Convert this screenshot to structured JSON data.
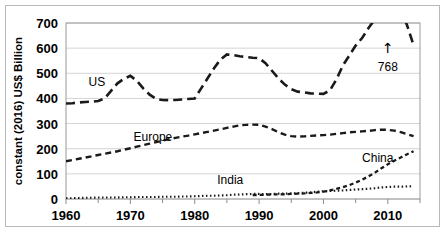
{
  "chart_data": {
    "type": "line",
    "title": "",
    "subtitle": "",
    "xlabel": "",
    "ylabel": "constant (2016) US$ Billion",
    "xlim": [
      1960,
      2015
    ],
    "ylim": [
      0,
      700
    ],
    "xticks": [
      1960,
      1970,
      1980,
      1990,
      2000,
      2010
    ],
    "xtick_labels": [
      "1960",
      "1970",
      "1980",
      "1990",
      "2000",
      "2010"
    ],
    "yticks": [
      0,
      100,
      200,
      300,
      400,
      500,
      600,
      700
    ],
    "ytick_labels": [
      "0",
      "100",
      "200",
      "300",
      "400",
      "500",
      "600",
      "700"
    ],
    "grid": "horizontal",
    "legend_position": "inline-labels",
    "x": [
      1960,
      1961,
      1962,
      1963,
      1964,
      1965,
      1966,
      1967,
      1968,
      1969,
      1970,
      1971,
      1972,
      1973,
      1974,
      1975,
      1976,
      1977,
      1978,
      1979,
      1980,
      1981,
      1982,
      1983,
      1984,
      1985,
      1986,
      1987,
      1988,
      1989,
      1990,
      1991,
      1992,
      1993,
      1994,
      1995,
      1996,
      1997,
      1998,
      1999,
      2000,
      2001,
      2002,
      2003,
      2004,
      2005,
      2006,
      2007,
      2008,
      2009,
      2010,
      2011,
      2012,
      2013,
      2014
    ],
    "series": [
      {
        "name": "US",
        "label": "US",
        "line_style": "long-dash",
        "color": "#1a1a1a",
        "values": [
          380,
          381,
          384,
          386,
          387,
          390,
          400,
          430,
          460,
          478,
          490,
          470,
          440,
          415,
          398,
          394,
          393,
          394,
          396,
          398,
          400,
          440,
          480,
          520,
          555,
          575,
          572,
          568,
          565,
          562,
          560,
          540,
          510,
          480,
          455,
          437,
          427,
          424,
          420,
          419,
          418,
          432,
          475,
          530,
          570,
          610,
          640,
          680,
          715,
          745,
          762,
          768,
          755,
          690,
          612
        ]
      },
      {
        "name": "Europe",
        "label": "Europe",
        "line_style": "medium-dash",
        "color": "#1a1a1a",
        "values": [
          150,
          155,
          160,
          165,
          170,
          175,
          180,
          185,
          190,
          196,
          202,
          208,
          214,
          220,
          226,
          232,
          238,
          243,
          248,
          252,
          257,
          262,
          267,
          272,
          277,
          283,
          288,
          293,
          295,
          296,
          295,
          288,
          278,
          266,
          256,
          250,
          248,
          249,
          251,
          253,
          254,
          256,
          259,
          262,
          265,
          267,
          269,
          271,
          274,
          276,
          275,
          272,
          266,
          258,
          250
        ]
      },
      {
        "name": "China",
        "label": "China",
        "line_style": "short-dash",
        "color": "#1a1a1a",
        "values": [
          null,
          null,
          null,
          null,
          null,
          null,
          null,
          null,
          null,
          null,
          null,
          null,
          null,
          null,
          null,
          null,
          null,
          null,
          null,
          null,
          null,
          null,
          null,
          null,
          null,
          null,
          null,
          null,
          null,
          16,
          16,
          17,
          18,
          18,
          19,
          20,
          21,
          22,
          24,
          26,
          29,
          34,
          40,
          47,
          55,
          65,
          77,
          90,
          105,
          122,
          138,
          152,
          165,
          178,
          190
        ]
      },
      {
        "name": "India",
        "label": "India",
        "line_style": "dotted",
        "color": "#1a1a1a",
        "values": [
          3,
          3,
          4,
          5,
          5,
          6,
          6,
          6,
          6,
          7,
          7,
          8,
          8,
          8,
          8,
          9,
          9,
          9,
          10,
          10,
          11,
          12,
          13,
          13,
          14,
          15,
          17,
          18,
          19,
          20,
          20,
          19,
          20,
          21,
          21,
          22,
          23,
          25,
          26,
          29,
          31,
          32,
          33,
          34,
          36,
          38,
          39,
          41,
          43,
          46,
          48,
          49,
          49,
          50,
          51
        ]
      }
    ],
    "annotations": [
      {
        "name": "us-peak-callout",
        "text": "768",
        "arrow": "↑",
        "x": 2010,
        "y": 768,
        "label_x": 2010,
        "label_y": 620
      }
    ],
    "series_label_positions": [
      {
        "name": "US",
        "x": 1963.5,
        "y": 448
      },
      {
        "name": "Europe",
        "x": 1970.5,
        "y": 232
      },
      {
        "name": "China",
        "x": 2006.0,
        "y": 148
      },
      {
        "name": "India",
        "x": 1983.5,
        "y": 58
      }
    ]
  }
}
